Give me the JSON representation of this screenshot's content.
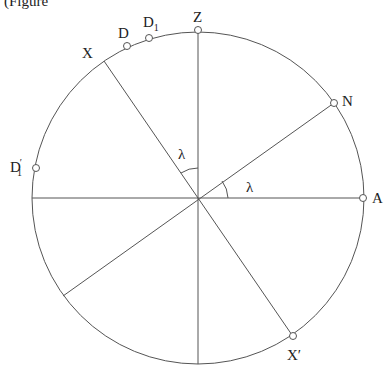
{
  "caption_fragment": "(Figure",
  "diagram": {
    "type": "celestial-sphere-meridian",
    "center": [
      198,
      198
    ],
    "radius": 166,
    "points": [
      {
        "id": "Z",
        "label": "Z",
        "sub": "",
        "prime": false
      },
      {
        "id": "N",
        "label": "N",
        "sub": "",
        "prime": false
      },
      {
        "id": "A",
        "label": "A",
        "sub": "",
        "prime": false
      },
      {
        "id": "X",
        "label": "X",
        "sub": "",
        "prime": false
      },
      {
        "id": "X_prime",
        "label": "X",
        "sub": "",
        "prime": true
      },
      {
        "id": "D",
        "label": "D",
        "sub": "",
        "prime": false
      },
      {
        "id": "D1",
        "label": "D",
        "sub": "1",
        "prime": false
      },
      {
        "id": "D1_prime",
        "label": "D",
        "sub": "1",
        "prime": true
      }
    ],
    "angles": [
      {
        "id": "lambda_upper",
        "label": "λ",
        "between": [
          "OZ",
          "OX"
        ]
      },
      {
        "id": "lambda_right",
        "label": "λ",
        "between": [
          "OA",
          "ON"
        ]
      }
    ],
    "lines": [
      "ZO (vertical diameter)",
      "D1'A (horizontal diameter)",
      "XX' (diameter)",
      "N through O (diameter)"
    ]
  },
  "labels": {
    "Z": "Z",
    "N": "N",
    "A": "A",
    "X": "X",
    "Xp": "X",
    "prime": "′",
    "D": "D",
    "D1": "D",
    "D1p": "D",
    "one": "1",
    "lambda1": "λ",
    "lambda2": "λ"
  }
}
